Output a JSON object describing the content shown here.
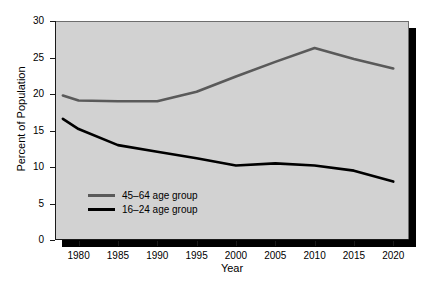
{
  "chart_data": {
    "type": "line",
    "title": "",
    "xlabel": "Year",
    "ylabel": "Percent of Population",
    "xlim": [
      1977,
      2022
    ],
    "ylim": [
      0,
      30
    ],
    "xticks": [
      1980,
      1985,
      1990,
      1995,
      2000,
      2005,
      2010,
      2015,
      2020
    ],
    "yticks": [
      0,
      5,
      10,
      15,
      20,
      25,
      30
    ],
    "grid": false,
    "legend_position": "lower left inside axes",
    "x": [
      1978,
      1980,
      1985,
      1990,
      1995,
      2000,
      2005,
      2010,
      2015,
      2020
    ],
    "series": [
      {
        "name": "45–64 age group",
        "color": "#5a5a5a",
        "values": [
          19.8,
          19.1,
          19.0,
          19.0,
          20.3,
          22.4,
          24.4,
          26.3,
          24.8,
          23.5
        ]
      },
      {
        "name": "16–24 age group",
        "color": "#000000",
        "values": [
          16.6,
          15.2,
          13.0,
          12.1,
          11.2,
          10.2,
          10.5,
          10.2,
          9.5,
          8.0
        ]
      }
    ]
  },
  "axes": {
    "ylabel": "Percent of Population",
    "xlabel": "Year",
    "ytick_labels": [
      "0",
      "5",
      "10",
      "15",
      "20",
      "25",
      "30"
    ],
    "xtick_labels": [
      "1980",
      "1985",
      "1990",
      "1995",
      "2000",
      "2005",
      "2010",
      "2015",
      "2020"
    ]
  },
  "legend": {
    "items": [
      {
        "label": "45–64 age group",
        "color": "#5a5a5a"
      },
      {
        "label": "16–24 age group",
        "color": "#000000"
      }
    ]
  },
  "colors": {
    "panel_background": "#d2d2d2",
    "page_background": "#ffffff",
    "axis": "#1a1a1a",
    "shadow": "#000000",
    "series_older": "#5a5a5a",
    "series_younger": "#000000"
  }
}
